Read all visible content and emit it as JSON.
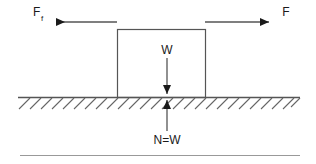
{
  "diagram": {
    "colors": {
      "stroke": "#555555",
      "arrow": "#1a1a1a",
      "text": "#1a1a1a",
      "hatch": "#666666",
      "rule": "#999999",
      "background": "#ffffff"
    },
    "labels": {
      "friction_force": "F",
      "friction_force_subscript": "f",
      "applied_force": "F",
      "weight": "W",
      "normal_force": "N=W"
    },
    "forces": [
      {
        "name": "friction-force",
        "symbol": "F",
        "subscript": "f",
        "direction": "left",
        "x1": 117,
        "y1": 22,
        "x2": 53,
        "y2": 22,
        "label_x": 36,
        "label_y": 15
      },
      {
        "name": "applied-force",
        "symbol": "F",
        "subscript": "",
        "direction": "right",
        "x1": 205,
        "y1": 22,
        "x2": 272,
        "y2": 22,
        "label_x": 285,
        "label_y": 15
      },
      {
        "name": "weight-force",
        "symbol": "W",
        "subscript": "",
        "direction": "down",
        "x1": 167,
        "y1": 58,
        "x2": 167,
        "y2": 98,
        "label_x": 167,
        "label_y": 53
      },
      {
        "name": "normal-force",
        "symbol": "N=W",
        "subscript": "",
        "direction": "up",
        "x1": 167,
        "y1": 131,
        "x2": 167,
        "y2": 96,
        "label_x": 167,
        "label_y": 142
      }
    ],
    "block": {
      "x": 117,
      "y": 29,
      "width": 88,
      "height": 68
    },
    "ground": {
      "x1": 18,
      "y1": 97,
      "x2": 300,
      "y2": 97,
      "hatch_count": 24,
      "hatch_length": 11
    },
    "bottom_rule": {
      "x1": 20,
      "y1": 155,
      "x2": 300,
      "y2": 155
    }
  }
}
